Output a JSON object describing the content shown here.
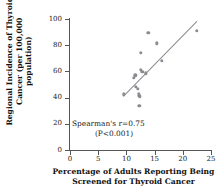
{
  "chart_data": {
    "type": "scatter",
    "title": "",
    "xlabel": "Percentage of Adults Reporting Being Screened for Thyroid Cancer",
    "ylabel": "Regional Incidence of Thyroid Cancer (per 100,000 population)",
    "xlim": [
      0,
      25
    ],
    "ylim": [
      0,
      100
    ],
    "xticks": [
      0,
      5,
      10,
      15,
      20,
      25
    ],
    "yticks": [
      0,
      20,
      40,
      60,
      80,
      100
    ],
    "grid": false,
    "legend": null,
    "point_color": "#8b8b92",
    "line_color": "#8b8b92",
    "points": [
      {
        "x": 9.5,
        "y": 42.5
      },
      {
        "x": 11.3,
        "y": 55.0
      },
      {
        "x": 11.6,
        "y": 57.0
      },
      {
        "x": 11.7,
        "y": 48.0
      },
      {
        "x": 12.0,
        "y": 46.5
      },
      {
        "x": 12.2,
        "y": 43.0
      },
      {
        "x": 12.3,
        "y": 41.5
      },
      {
        "x": 12.4,
        "y": 40.5
      },
      {
        "x": 12.3,
        "y": 34.0
      },
      {
        "x": 12.5,
        "y": 61.0
      },
      {
        "x": 12.8,
        "y": 59.5
      },
      {
        "x": 12.6,
        "y": 74.0
      },
      {
        "x": 13.4,
        "y": 58.5
      },
      {
        "x": 13.9,
        "y": 89.5
      },
      {
        "x": 15.4,
        "y": 81.5
      },
      {
        "x": 16.3,
        "y": 68.0
      },
      {
        "x": 22.5,
        "y": 91.0
      }
    ],
    "trendline": {
      "x1": 9.3,
      "y1": 41.5,
      "x2": 22.3,
      "y2": 98.5
    },
    "annotation": {
      "line1": "Spearman's r=0.75",
      "line2": "(P<0.001)",
      "statistic_name": "Spearman's r",
      "statistic_value": 0.75,
      "p_value": "<0.001"
    }
  }
}
